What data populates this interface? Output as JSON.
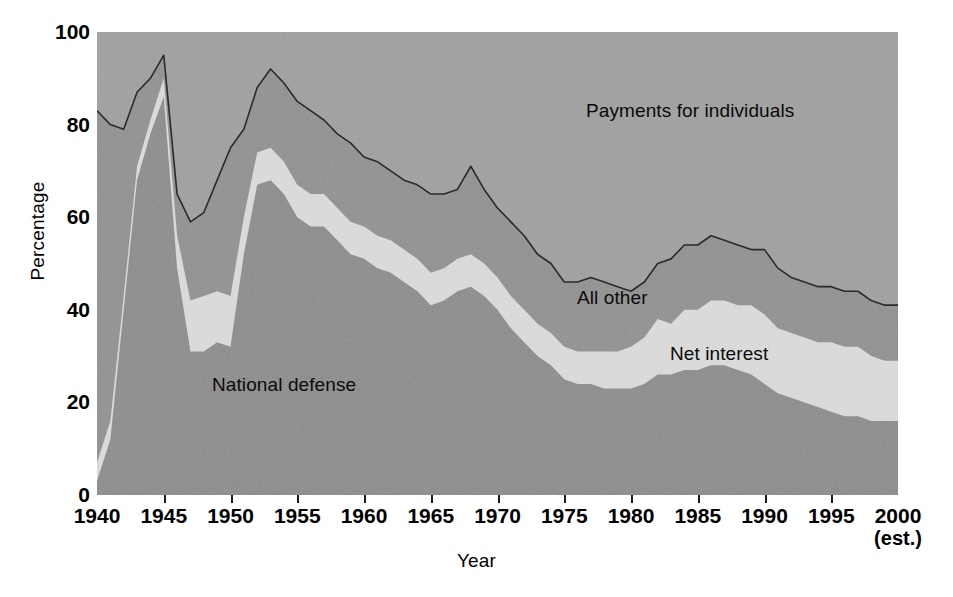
{
  "chart_data": {
    "type": "area",
    "stacked": true,
    "title": "",
    "subtitle": "",
    "xlabel": "Year",
    "ylabel": "Percentage",
    "xlim": [
      1940,
      2000
    ],
    "ylim": [
      0,
      100
    ],
    "grid": false,
    "legend_position": "inline-annotations",
    "x_tick_labels": [
      "1940",
      "1945",
      "1950",
      "1955",
      "1960",
      "1965",
      "1970",
      "1975",
      "1980",
      "1985",
      "1990",
      "1995",
      "2000"
    ],
    "x_tick_values": [
      1940,
      1945,
      1950,
      1955,
      1960,
      1965,
      1970,
      1975,
      1980,
      1985,
      1990,
      1995,
      2000
    ],
    "x_last_tick_note": "(est.)",
    "y_tick_labels": [
      "0",
      "20",
      "40",
      "60",
      "80",
      "100"
    ],
    "y_tick_values": [
      0,
      20,
      40,
      60,
      80,
      100
    ],
    "x": [
      1940,
      1941,
      1942,
      1943,
      1944,
      1945,
      1946,
      1947,
      1948,
      1949,
      1950,
      1951,
      1952,
      1953,
      1954,
      1955,
      1956,
      1957,
      1958,
      1959,
      1960,
      1961,
      1962,
      1963,
      1964,
      1965,
      1966,
      1967,
      1968,
      1969,
      1970,
      1971,
      1972,
      1973,
      1974,
      1975,
      1976,
      1977,
      1978,
      1979,
      1980,
      1981,
      1982,
      1983,
      1984,
      1985,
      1986,
      1987,
      1988,
      1989,
      1990,
      1991,
      1992,
      1993,
      1994,
      1995,
      1996,
      1997,
      1998,
      1999,
      2000
    ],
    "series": [
      {
        "name": "National defense",
        "color": "#8c8c8c",
        "stack_order": 1,
        "values": [
          3,
          12,
          40,
          68,
          78,
          86,
          49,
          31,
          31,
          33,
          32,
          52,
          67,
          68,
          65,
          60,
          58,
          58,
          55,
          52,
          51,
          49,
          48,
          46,
          44,
          41,
          42,
          44,
          45,
          43,
          40,
          36,
          33,
          30,
          28,
          25,
          24,
          24,
          23,
          23,
          23,
          24,
          26,
          26,
          27,
          27,
          28,
          28,
          27,
          26,
          24,
          22,
          21,
          20,
          19,
          18,
          17,
          17,
          16,
          16,
          16
        ]
      },
      {
        "name": "Net interest",
        "color": "#dcdcdc",
        "stack_order": 2,
        "values": [
          4,
          4,
          3,
          3,
          3,
          4,
          7,
          11,
          12,
          11,
          11,
          8,
          7,
          7,
          7,
          7,
          7,
          7,
          7,
          7,
          7,
          7,
          7,
          7,
          7,
          7,
          7,
          7,
          7,
          7,
          7,
          7,
          7,
          7,
          7,
          7,
          7,
          7,
          8,
          8,
          9,
          10,
          12,
          11,
          13,
          13,
          14,
          14,
          14,
          15,
          15,
          14,
          14,
          14,
          14,
          15,
          15,
          15,
          14,
          13,
          13
        ]
      },
      {
        "name": "All other",
        "color": "#919191",
        "stack_order": 3,
        "values": [
          76,
          64,
          36,
          16,
          9,
          5,
          9,
          17,
          18,
          24,
          32,
          19,
          14,
          17,
          17,
          18,
          18,
          16,
          16,
          17,
          15,
          16,
          15,
          15,
          16,
          17,
          16,
          15,
          19,
          16,
          15,
          16,
          16,
          15,
          15,
          14,
          15,
          16,
          15,
          14,
          12,
          12,
          12,
          14,
          14,
          14,
          14,
          13,
          13,
          12,
          14,
          13,
          12,
          12,
          12,
          12,
          12,
          12,
          12,
          12,
          12
        ]
      },
      {
        "name": "Payments for individuals",
        "color": "#a0a0a0",
        "stack_order": 4,
        "values": [
          17,
          20,
          21,
          13,
          10,
          5,
          35,
          41,
          39,
          32,
          25,
          21,
          12,
          8,
          11,
          15,
          17,
          19,
          22,
          24,
          27,
          28,
          30,
          32,
          33,
          35,
          35,
          34,
          29,
          34,
          38,
          41,
          44,
          48,
          50,
          54,
          54,
          53,
          54,
          55,
          56,
          54,
          50,
          49,
          46,
          46,
          44,
          45,
          46,
          47,
          47,
          51,
          53,
          54,
          55,
          55,
          56,
          56,
          58,
          59,
          59
        ]
      }
    ],
    "stack_boundaries": {
      "note": "cumulative top of each band, percent of total federal outlays",
      "defense_top": [
        3,
        12,
        40,
        68,
        78,
        86,
        49,
        31,
        31,
        33,
        32,
        52,
        67,
        68,
        65,
        60,
        58,
        58,
        55,
        52,
        51,
        49,
        48,
        46,
        44,
        41,
        42,
        44,
        45,
        43,
        40,
        36,
        33,
        30,
        28,
        25,
        24,
        24,
        23,
        23,
        23,
        24,
        26,
        26,
        27,
        27,
        28,
        28,
        27,
        26,
        24,
        22,
        21,
        20,
        19,
        18,
        17,
        17,
        16,
        16,
        16
      ],
      "net_interest_top": [
        7,
        16,
        43,
        71,
        81,
        90,
        56,
        42,
        43,
        44,
        43,
        60,
        74,
        75,
        72,
        67,
        65,
        65,
        62,
        59,
        58,
        56,
        55,
        53,
        51,
        48,
        49,
        51,
        52,
        50,
        47,
        43,
        40,
        37,
        35,
        32,
        31,
        31,
        31,
        31,
        32,
        34,
        38,
        37,
        40,
        40,
        42,
        42,
        41,
        41,
        39,
        36,
        35,
        34,
        33,
        33,
        32,
        32,
        30,
        29,
        29
      ],
      "all_other_top": [
        83,
        80,
        79,
        87,
        90,
        95,
        65,
        59,
        61,
        68,
        75,
        79,
        88,
        92,
        89,
        85,
        83,
        81,
        78,
        76,
        73,
        72,
        70,
        68,
        67,
        65,
        65,
        66,
        71,
        66,
        62,
        59,
        56,
        52,
        50,
        46,
        46,
        47,
        46,
        45,
        44,
        46,
        50,
        51,
        54,
        54,
        56,
        55,
        54,
        53,
        53,
        49,
        47,
        46,
        45,
        45,
        44,
        44,
        42,
        41,
        41
      ],
      "total_top": [
        100,
        100,
        100,
        100,
        100,
        100,
        100,
        100,
        100,
        100,
        100,
        100,
        100,
        100,
        100,
        100,
        100,
        100,
        100,
        100,
        100,
        100,
        100,
        100,
        100,
        100,
        100,
        100,
        100,
        100,
        100,
        100,
        100,
        100,
        100,
        100,
        100,
        100,
        100,
        100,
        100,
        100,
        100,
        100,
        100,
        100,
        100,
        100,
        100,
        100,
        100,
        100,
        100,
        100,
        100,
        100,
        100,
        100,
        100,
        100,
        100
      ]
    },
    "annotations": [
      {
        "text": "Payments for individuals",
        "x_px": 586,
        "y_px": 100
      },
      {
        "text": "All other",
        "x_px": 577,
        "y_px": 287
      },
      {
        "text": "Net interest",
        "x_px": 670,
        "y_px": 343
      },
      {
        "text": "National defense",
        "x_px": 212,
        "y_px": 374
      },
      {
        "text": "(est.)",
        "x_px": 875,
        "y_px": 530
      }
    ]
  },
  "axes": {
    "y_title": "Percentage",
    "x_title": "Year"
  },
  "colors": {
    "national_defense": "#8c8c8c",
    "net_interest": "#dcdcdc",
    "all_other": "#919191",
    "payments_for_individuals": "#a0a0a0",
    "outline": "#2b2b2b",
    "text": "#0a0a0a",
    "background": "#ffffff"
  }
}
